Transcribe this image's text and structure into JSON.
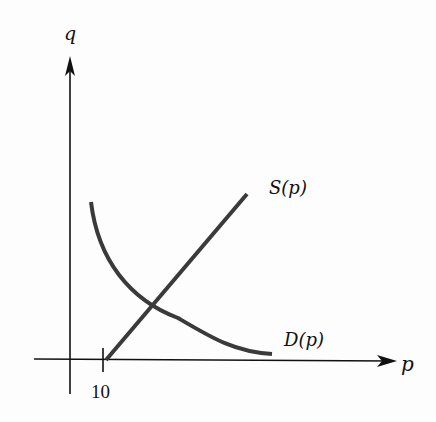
{
  "diagram": {
    "type": "supply-demand-graph",
    "axes": {
      "x_label": "p",
      "y_label": "q"
    },
    "ticks": [
      {
        "label": "10"
      }
    ],
    "curves": [
      {
        "name": "supply",
        "label": "S(p)",
        "shape": "straight line, upward sloping"
      },
      {
        "name": "demand",
        "label": "D(p)",
        "shape": "decreasing convex curve"
      }
    ],
    "colors": {
      "axis": "#111111",
      "curve": "#3a3a3a",
      "background": "#fdfdfd"
    }
  }
}
